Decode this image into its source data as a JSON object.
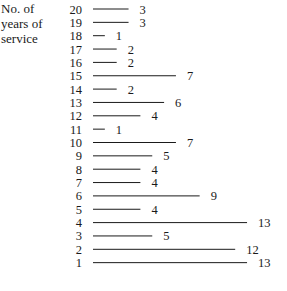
{
  "chart_data": {
    "type": "bar",
    "orientation": "horizontal",
    "title": "",
    "ylabel": "No. of years of service",
    "ylabel_lines": [
      "No. of",
      "years of",
      "service"
    ],
    "xlabel": "",
    "categories": [
      "20",
      "19",
      "18",
      "17",
      "16",
      "15",
      "14",
      "13",
      "12",
      "11",
      "10",
      "9",
      "8",
      "7",
      "6",
      "5",
      "4",
      "3",
      "2",
      "1"
    ],
    "values": [
      3,
      3,
      1,
      2,
      2,
      7,
      2,
      6,
      4,
      1,
      7,
      5,
      4,
      4,
      9,
      4,
      13,
      5,
      12,
      13
    ],
    "xlim": [
      0,
      13
    ],
    "grid": false,
    "legend": "none",
    "data_labels": true,
    "line_color": "#1a1a1a"
  }
}
